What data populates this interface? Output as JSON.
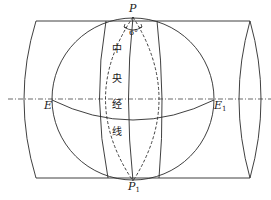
{
  "diagram": {
    "labels": {
      "north_pole": "P",
      "south_pole_base": "P",
      "south_pole_sub": "1",
      "equator_left": "E",
      "equator_right_base": "E",
      "equator_right_sub": "1",
      "angle": "6°",
      "central_meridian_chars": [
        "中",
        "央",
        "经",
        "线"
      ]
    },
    "central_meridian_text": "中央经线",
    "colors": {
      "stroke": "#2a2a2a",
      "background": "#ffffff"
    },
    "elements": [
      "cylinder",
      "sphere",
      "central-meridian",
      "zone-boundary-meridians",
      "dashed-6-degree-zone",
      "equator-arc",
      "dash-dot-axis"
    ]
  }
}
